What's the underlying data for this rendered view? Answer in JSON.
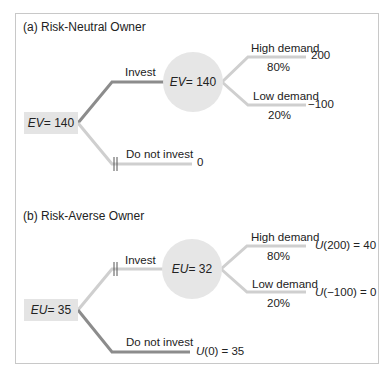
{
  "colors": {
    "chosen_branch": "#8c8c8c",
    "other_branch": "#cfcfcf",
    "node_fill": "#e4e4e4",
    "frame_border": "#c8c8c8"
  },
  "panel_a": {
    "title": "(a) Risk-Neutral Owner",
    "decision_node": {
      "var": "EV",
      "eq": " = 140"
    },
    "chance_node": {
      "var": "EV",
      "eq": " = 140"
    },
    "invest_label": "Invest",
    "not_invest_label": "Do not invest",
    "not_invest_payoff": "0",
    "high": {
      "label": "High demand",
      "prob": "80%",
      "payoff": "200"
    },
    "low": {
      "label": "Low demand",
      "prob": "20%",
      "payoff": "−100"
    },
    "chosen": "Invest",
    "pruned": "Do not invest"
  },
  "panel_b": {
    "title": "(b) Risk-Averse Owner",
    "decision_node": {
      "var": "EU",
      "eq": " = 35"
    },
    "chance_node": {
      "var": "EU",
      "eq": " = 32"
    },
    "invest_label": "Invest",
    "not_invest_label": "Do not invest",
    "not_invest_payoff": {
      "u": "U",
      "rest": "(0) = 35"
    },
    "high": {
      "label": "High demand",
      "prob": "80%",
      "payoff": {
        "u": "U",
        "rest": "(200) = 40"
      }
    },
    "low": {
      "label": "Low demand",
      "prob": "20%",
      "payoff": {
        "u": "U",
        "rest": "(−100) = 0"
      }
    },
    "chosen": "Do not invest",
    "pruned": "Invest"
  }
}
